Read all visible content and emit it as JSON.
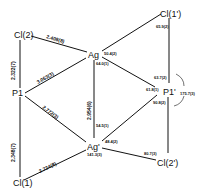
{
  "atoms": {
    "cl2": "Cl(2)",
    "ag": "Ag",
    "cl1p": "Cl(1')",
    "p1": "P1",
    "p1p": "P1'",
    "cl1": "Cl(1)",
    "agp": "Ag'",
    "cl2p": "Cl(2')"
  },
  "distances": {
    "cl2_ag": "2.408(8)",
    "cl2_p1": "2.322(7)",
    "p1_ag": "3.063(3)",
    "ag_agp": "2.954(6)",
    "p1_agp": "2.772(3)",
    "p1_cl1": "2.348(7)",
    "cl1_agp": "2.724(8)"
  },
  "angles": {
    "ag_top": "50.4(2)",
    "ag_left": "64.0(1)",
    "cl1p_top": "65.9(2)",
    "p1p_upper": "63.7(2)",
    "p1p_left": "61.8(1)",
    "p1p_arc": "175.7(3)",
    "p1p_lower": "90.8(2)",
    "agp_upper": "54.5(1)",
    "agp_right": "48.4(2)",
    "agp_lower": "141.3(3)",
    "cl2p_left": "80.7(3)"
  }
}
